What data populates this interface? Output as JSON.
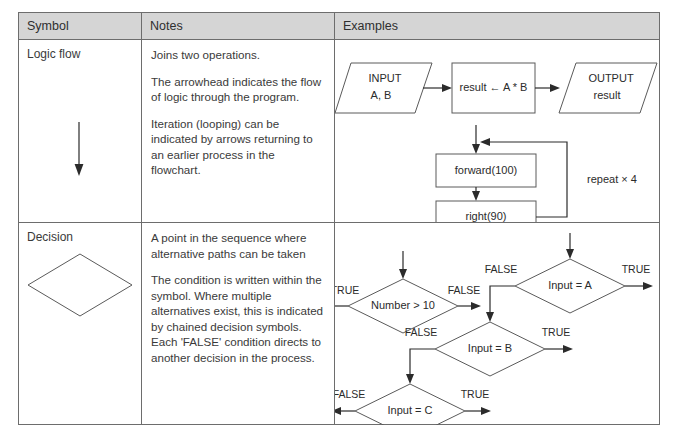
{
  "table": {
    "headers": [
      {
        "label": "Symbol"
      },
      {
        "label": "Notes"
      },
      {
        "label": "Examples"
      }
    ],
    "rows": [
      {
        "symbol_name": "Logic flow",
        "symbol_icon": "down-arrow-glyph",
        "notes": [
          "Joins two operations.",
          "The arrowhead indicates the flow of logic through the program.",
          "Iteration (looping) can be indicated by arrows returning to an earlier process in the flowchart."
        ],
        "example": {
          "diagram_name": "logic-flow-example-diagram",
          "nodes": [
            {
              "id": "input",
              "shape": "parallelogram",
              "lines": [
                "INPUT",
                "A, B"
              ]
            },
            {
              "id": "process",
              "shape": "rectangle",
              "lines": [
                "result ← A * B"
              ]
            },
            {
              "id": "output",
              "shape": "parallelogram",
              "lines": [
                "OUTPUT",
                "result"
              ]
            },
            {
              "id": "forward",
              "shape": "rectangle",
              "lines": [
                "forward(100)"
              ]
            },
            {
              "id": "right",
              "shape": "rectangle",
              "lines": [
                "right(90)"
              ]
            }
          ],
          "annotations": [
            {
              "id": "repeat",
              "text": "repeat × 4"
            }
          ]
        }
      },
      {
        "symbol_name": "Decision",
        "symbol_icon": "diamond-glyph",
        "notes": [
          "A point in the sequence where alternative paths can be taken",
          "The condition is written within the symbol. Where multiple alternatives exist, this is indicated by chained decision symbols. Each 'FALSE' condition directs to another decision in the process."
        ],
        "example": {
          "diagram_name": "decision-example-diagram",
          "nodes": [
            {
              "id": "number10",
              "shape": "diamond",
              "text": "Number > 10"
            },
            {
              "id": "inputA",
              "shape": "diamond",
              "text": "Input = A"
            },
            {
              "id": "inputB",
              "shape": "diamond",
              "text": "Input = B"
            },
            {
              "id": "inputC",
              "shape": "diamond",
              "text": "Input = C"
            }
          ],
          "branch_labels": [
            {
              "node": "number10",
              "side": "left",
              "text": "TRUE"
            },
            {
              "node": "number10",
              "side": "right",
              "text": "FALSE"
            },
            {
              "node": "inputA",
              "side": "left",
              "text": "FALSE"
            },
            {
              "node": "inputA",
              "side": "right",
              "text": "TRUE"
            },
            {
              "node": "inputB",
              "side": "left",
              "text": "FALSE"
            },
            {
              "node": "inputB",
              "side": "right",
              "text": "TRUE"
            },
            {
              "node": "inputC",
              "side": "left",
              "text": "FALSE"
            },
            {
              "node": "inputC",
              "side": "right",
              "text": "TRUE"
            }
          ]
        }
      }
    ]
  },
  "colors": {
    "header_bg": "#d5d5d5",
    "border": "#6d6d6d",
    "shape_stroke": "#5a5a5a",
    "line_stroke": "#2b2b2b",
    "text": "#3a3a3a"
  }
}
